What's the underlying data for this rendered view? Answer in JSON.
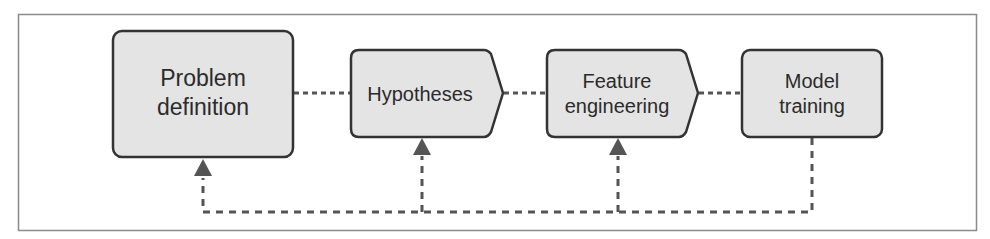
{
  "diagram": {
    "colors": {
      "frame": "#8a8a8a",
      "node_fill": "#e4e4e4",
      "node_stroke": "#333333",
      "connector": "#555555",
      "text": "#2b2b2b"
    },
    "nodes": [
      {
        "id": "problem-definition",
        "lines": [
          "Problem",
          "definition"
        ],
        "shape": "rounded-rect"
      },
      {
        "id": "hypotheses",
        "lines": [
          "Hypotheses"
        ],
        "shape": "pentagon-arrow"
      },
      {
        "id": "feature-engineering",
        "lines": [
          "Feature",
          "engineering"
        ],
        "shape": "pentagon-arrow"
      },
      {
        "id": "model-training",
        "lines": [
          "Model",
          "training"
        ],
        "shape": "rounded-rect"
      }
    ],
    "edges": [
      {
        "from": "problem-definition",
        "to": "hypotheses",
        "style": "dotted"
      },
      {
        "from": "hypotheses",
        "to": "feature-engineering",
        "style": "dotted"
      },
      {
        "from": "feature-engineering",
        "to": "model-training",
        "style": "dotted"
      },
      {
        "from": "model-training",
        "to": "feature-engineering",
        "style": "dashed-feedback"
      },
      {
        "from": "model-training",
        "to": "hypotheses",
        "style": "dashed-feedback"
      },
      {
        "from": "model-training",
        "to": "problem-definition",
        "style": "dashed-feedback"
      }
    ]
  }
}
